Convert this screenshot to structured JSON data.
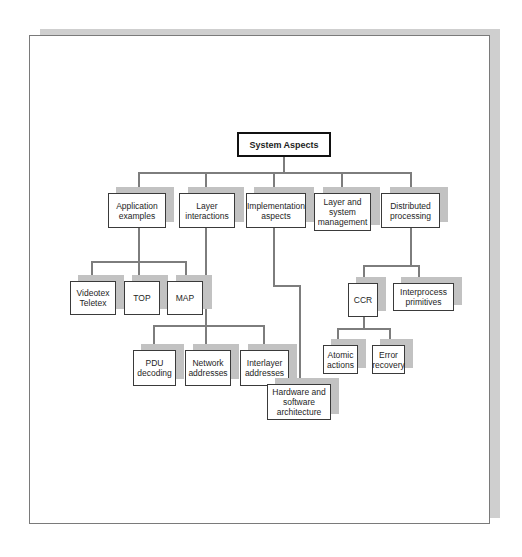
{
  "diagram": {
    "root": {
      "label": "System Aspects"
    },
    "level1": [
      {
        "label": "Application\nexamples"
      },
      {
        "label": "Layer\ninteractions"
      },
      {
        "label": "Implementation\naspects"
      },
      {
        "label": "Layer and\nsystem\nmanagement"
      },
      {
        "label": "Distributed\nprocessing"
      }
    ],
    "application_children": [
      {
        "label": "Videotex\nTeletex"
      },
      {
        "label": "TOP"
      },
      {
        "label": "MAP"
      }
    ],
    "layer_children": [
      {
        "label": "PDU\ndecoding"
      },
      {
        "label": "Network\naddresses"
      },
      {
        "label": "Interlayer\naddresses"
      }
    ],
    "implementation_children": [
      {
        "label": "Hardware and\nsoftware\narchitecture"
      }
    ],
    "distributed_children": [
      {
        "label": "CCR"
      },
      {
        "label": "Interprocess\nprimitives"
      }
    ],
    "ccr_children": [
      {
        "label": "Atomic\nactions"
      },
      {
        "label": "Error\nrecovery"
      }
    ],
    "colors": {
      "line": "#7d7d7d",
      "shadow": "#c2c2c2",
      "border": "#3a3a3a"
    }
  }
}
